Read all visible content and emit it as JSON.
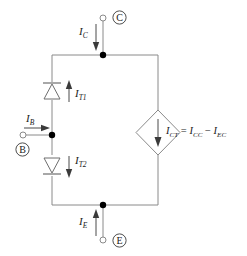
{
  "diagram": {
    "type": "circuit-schematic",
    "colors": {
      "wire": "#8a8a8a",
      "node": "#000000",
      "text": "#1a1a1a",
      "background": "#ffffff"
    },
    "terminals": [
      {
        "id": "collector",
        "letter": "C",
        "current_label": "I",
        "current_sub": "C",
        "direction": "down"
      },
      {
        "id": "base",
        "letter": "B",
        "current_label": "I",
        "current_sub": "B",
        "direction": "right"
      },
      {
        "id": "emitter",
        "letter": "E",
        "current_label": "I",
        "current_sub": "E",
        "direction": "up"
      }
    ],
    "diodes": [
      {
        "id": "diode-upper",
        "current_label": "I",
        "current_sub": "T1",
        "arrow_direction": "up",
        "orientation": "cathode-up"
      },
      {
        "id": "diode-lower",
        "current_label": "I",
        "current_sub": "T2",
        "arrow_direction": "down",
        "orientation": "cathode-down"
      }
    ],
    "current_source": {
      "id": "transport-current-source",
      "shape": "diamond",
      "arrow_direction": "down",
      "equation": {
        "lhs_symbol": "I",
        "lhs_sub": "CT",
        "equals": "=",
        "term1_symbol": "I",
        "term1_sub": "CC",
        "operator": "−",
        "term2_symbol": "I",
        "term2_sub": "EC"
      }
    }
  }
}
